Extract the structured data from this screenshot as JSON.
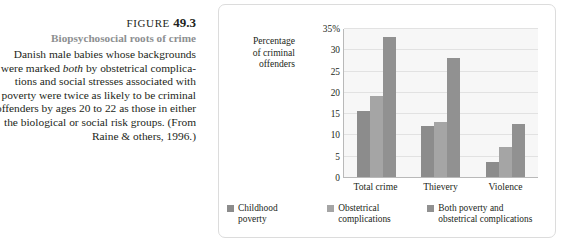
{
  "caption": {
    "figure_prefix": "FIGURE",
    "figure_number": "49.3",
    "subtitle": "Biopsychosocial roots of crime",
    "body_lines": [
      "Danish male babies whose backgrounds",
      "were marked |both| by obstetrical complica-",
      "tions and social stresses associated with",
      "poverty were twice as likely to be criminal",
      "offenders by ages 20 to 22 as those in either",
      "the biological or social risk groups. (From",
      "Raine & others, 1996.)"
    ]
  },
  "chart_data": {
    "type": "bar",
    "title": "Biopsychosocial roots of crime",
    "xlabel": "",
    "ylabel": "Percentage of criminal offenders",
    "ylabel_lines": [
      "Percentage",
      "of criminal",
      "offenders"
    ],
    "categories": [
      "Total crime",
      "Thievery",
      "Violence"
    ],
    "series": [
      {
        "name": "Childhood poverty",
        "values": [
          15.5,
          12.0,
          3.5
        ],
        "color": "#8c8c8c"
      },
      {
        "name": "Obstetrical complications",
        "values": [
          19.0,
          13.0,
          7.0
        ],
        "color": "#a5a5a5"
      },
      {
        "name": "Both poverty and obstetrical complications",
        "values": [
          33.0,
          28.0,
          12.5
        ],
        "color": "#919191"
      }
    ],
    "ylim": [
      0,
      35
    ],
    "yticks": [
      0,
      5,
      10,
      15,
      20,
      25,
      30,
      35
    ],
    "ytick_labels": [
      "0",
      "5",
      "10",
      "15",
      "20",
      "25",
      "30",
      "35%"
    ],
    "grid": true,
    "legend_position": "bottom",
    "plot_background": "#f7f7f7",
    "axis_color": "#b9b9b9",
    "gridline_color": "#e2e2e2"
  },
  "legend": [
    {
      "label_lines": [
        "Childhood",
        "poverty"
      ],
      "color": "#8c8c8c"
    },
    {
      "label_lines": [
        "Obstetrical",
        "complications"
      ],
      "color": "#a5a5a5"
    },
    {
      "label_lines": [
        "Both poverty and",
        "obstetrical complications"
      ],
      "color": "#919191"
    }
  ],
  "colors": {
    "text": "#231f20",
    "subtitle": "#8d8f91",
    "panel_border": "#dcdcdc",
    "page_background": "#ffffff"
  }
}
